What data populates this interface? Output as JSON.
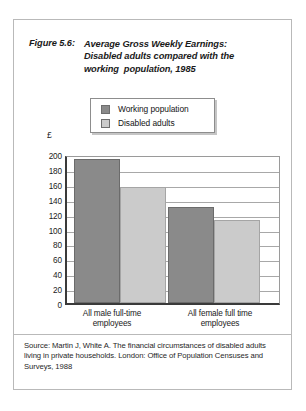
{
  "figure": {
    "number": "Figure 5.6:",
    "title_lines": [
      "Average Gross Weekly Earnings:",
      "Disabled adults compared with the",
      "working  population, 1985"
    ],
    "source": "Source: Martin J, White A. The financial circumstances of disabled adults living in private households. London: Office of Population Censuses and Surveys, 1988"
  },
  "colors": {
    "working_population": "#8a8a8a",
    "disabled_adults": "#cbcbcb",
    "axis": "#3a3a3a",
    "gridline": "#a8a8a8"
  },
  "chart_data": {
    "type": "bar",
    "title": "Average Gross Weekly Earnings: Disabled adults compared with the working  population, 1985",
    "xlabel": "",
    "ylabel": "£",
    "ylim": [
      0,
      200
    ],
    "yticks": [
      0,
      20,
      40,
      60,
      80,
      100,
      120,
      140,
      160,
      180,
      200
    ],
    "ytick_labels": [
      "0",
      "20",
      "40",
      "60",
      "80",
      "100",
      "120",
      "140",
      "160",
      "180",
      "200"
    ],
    "grid": true,
    "legend_position": "top-center",
    "categories": [
      "All male full-time employees",
      "All female full time employees"
    ],
    "category_label_lines": [
      [
        "All male full-time",
        "employees"
      ],
      [
        "All female full time",
        "employees"
      ]
    ],
    "series": [
      {
        "name": "Working population",
        "values": [
          193,
          129
        ],
        "color": "#8a8a8a"
      },
      {
        "name": "Disabled adults",
        "values": [
          156,
          111
        ],
        "color": "#cbcbcb"
      }
    ]
  }
}
